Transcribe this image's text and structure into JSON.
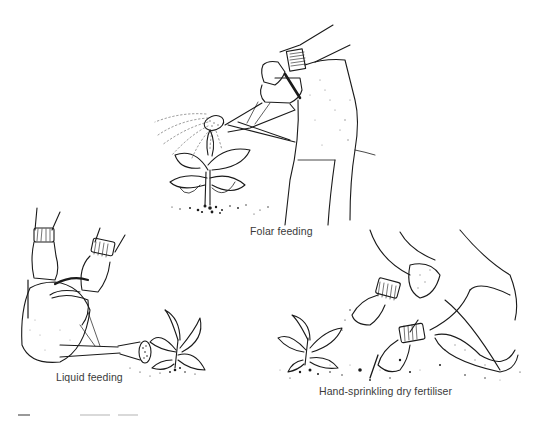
{
  "figure": {
    "style": "pen-and-ink stipple illustration",
    "ink_color": "#1a1a1a",
    "background": "#ffffff",
    "panels": [
      {
        "id": "foliar",
        "caption": "Folar feeding",
        "depicts": "gardener in trousers tilting a watering can with rose, spraying a leafy plant from above",
        "icon": "watering-can-icon"
      },
      {
        "id": "liquid",
        "caption": "Liquid feeding",
        "depicts": "two hands with ribbed cuffs holding a large watering can, pouring at base of a small plant",
        "icon": "watering-can-icon"
      },
      {
        "id": "dry",
        "caption": "Hand-sprinkling dry fertiliser",
        "depicts": "kneeling gardener sprinkling granules by hand around a young plant on stippled soil",
        "icon": "hand-icon"
      }
    ]
  }
}
